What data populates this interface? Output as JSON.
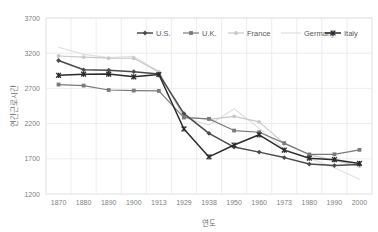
{
  "chart_data": {
    "type": "line",
    "title": "",
    "xlabel": "연도",
    "ylabel": "연간근로시간",
    "categories": [
      "1870",
      "1880",
      "1890",
      "1900",
      "1913",
      "1929",
      "1938",
      "1950",
      "1960",
      "1973",
      "1980",
      "1990",
      "2000"
    ],
    "ylim": [
      1200,
      3700
    ],
    "ytick_labels": [
      "1200",
      "1700",
      "2200",
      "2700",
      "3200",
      "3700"
    ],
    "yticks": [
      1200,
      1700,
      2200,
      2700,
      3200,
      3700
    ],
    "grid": true,
    "legend_position": "top-center",
    "series": [
      {
        "name": "U.S.",
        "color": "#4a4a4a",
        "marker": "diamond",
        "values": [
          3096,
          2964,
          2958,
          2938,
          2904,
          2342,
          2062,
          1867,
          1795,
          1717,
          1625,
          1604,
          1620
        ]
      },
      {
        "name": "U.K.",
        "color": "#7a7a7a",
        "marker": "square",
        "values": [
          2755,
          2740,
          2677,
          2669,
          2664,
          2286,
          2267,
          2101,
          2077,
          1922,
          1762,
          1764,
          1827
        ]
      },
      {
        "name": "France",
        "color": "#c8c8c8",
        "marker": "circle",
        "values": [
          3160,
          3145,
          3130,
          3128,
          2935,
          2297,
          2260,
          2303,
          2224,
          1915,
          1759,
          1677,
          1596
        ]
      },
      {
        "name": "Germany",
        "color": "#e0e0e0",
        "marker": "none",
        "values": [
          3284,
          3184,
          3138,
          3154,
          2939,
          2289,
          2179,
          2412,
          2134,
          1836,
          1708,
          1574,
          1410
        ]
      },
      {
        "name": "Italy",
        "color": "#2b2b2b",
        "marker": "star",
        "values": [
          2886,
          2902,
          2903,
          2865,
          2897,
          2124,
          1727,
          1896,
          2041,
          1823,
          1709,
          1688,
          1634
        ]
      }
    ]
  },
  "axis": {
    "y_label": "연간근로시간",
    "x_label": "연도"
  },
  "legend": {
    "entries": [
      {
        "label": "U.S."
      },
      {
        "label": "U.K."
      },
      {
        "label": "France"
      },
      {
        "label": "Germany"
      },
      {
        "label": "Italy"
      }
    ]
  },
  "colors": {
    "plot_border": "#d9d9d9",
    "grid": "#e8e8e8",
    "text": "#808080",
    "background": "#ffffff"
  }
}
